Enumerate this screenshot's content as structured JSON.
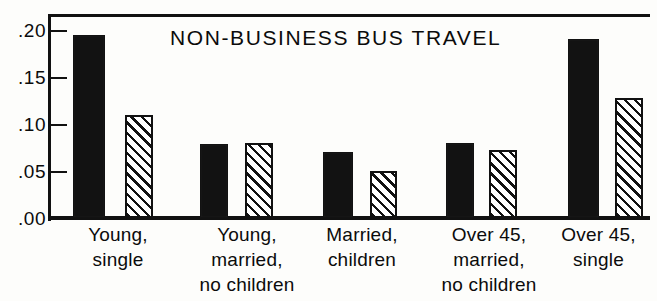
{
  "chart_data": {
    "type": "bar",
    "title": "NON-BUSINESS BUS TRAVEL",
    "xlabel": "",
    "ylabel": "",
    "ylim": [
      0.0,
      0.2
    ],
    "yticks": [
      0.0,
      0.05,
      0.1,
      0.15,
      0.2
    ],
    "ytick_labels": [
      ".00",
      ".05",
      ".10",
      ".15",
      ".20"
    ],
    "grid": false,
    "legend": null,
    "categories": [
      "Young, single",
      "Young, married, no children",
      "Married, children",
      "Over 45, married, no children",
      "Over 45, single"
    ],
    "category_lines": [
      [
        "Young,",
        "single"
      ],
      [
        "Young,",
        "married,",
        "no children"
      ],
      [
        "Married,",
        "children"
      ],
      [
        "Over 45,",
        "married,",
        "no children"
      ],
      [
        "Over 45,",
        "single"
      ]
    ],
    "series": [
      {
        "name": "solid",
        "fill": "solid-black",
        "color": "#121212",
        "values": [
          0.195,
          0.079,
          0.07,
          0.08,
          0.19
        ]
      },
      {
        "name": "hatched",
        "fill": "diagonal-hatch",
        "color": "#ffffff",
        "values": [
          0.11,
          0.08,
          0.05,
          0.072,
          0.128
        ]
      }
    ]
  },
  "axis": {
    "tick_00": ".00",
    "tick_05": ".05",
    "tick_10": ".10",
    "tick_15": ".15",
    "tick_20": ".20"
  }
}
